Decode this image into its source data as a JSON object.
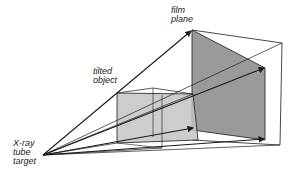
{
  "diagram": {
    "labels": {
      "film_plane_line1": "film",
      "film_plane_line2": "plane",
      "tilted_object_line1": "tilted",
      "tilted_object_line2": "object",
      "source_line1": "X-ray",
      "source_line2": "tube",
      "source_line3": "target"
    },
    "colors": {
      "line": "#1a1a1a",
      "film_fill": "#9a9a9a",
      "object_fill": "#c4c4c4",
      "background": "#ffffff"
    }
  }
}
